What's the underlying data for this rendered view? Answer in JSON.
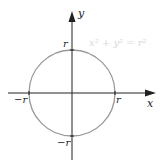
{
  "diagram": {
    "equation": "x² + y² = r²",
    "axes": {
      "x_label": "x",
      "y_label": "y"
    },
    "intercepts": {
      "top": "r",
      "bottom": "−r",
      "left": "−r",
      "right": "r"
    },
    "colors": {
      "axis": "#222222",
      "circle": "#999999",
      "equation": "#d8d8d8"
    }
  }
}
